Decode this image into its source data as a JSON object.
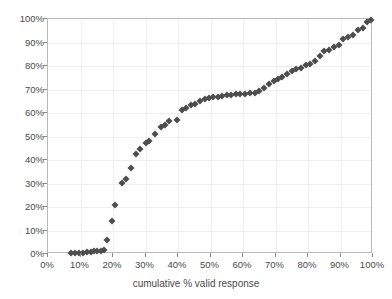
{
  "chart_data": {
    "type": "scatter",
    "title": "",
    "xlabel": "cumulative % valid response",
    "ylabel": "",
    "xlim": [
      0,
      100
    ],
    "ylim": [
      0,
      100
    ],
    "grid": true,
    "legend": null,
    "marker": {
      "shape": "diamond",
      "color": "#4d4d4d",
      "size": 5
    },
    "x_ticks": [
      "0%",
      "10%",
      "20%",
      "30%",
      "40%",
      "50%",
      "60%",
      "70%",
      "80%",
      "90%",
      "100%"
    ],
    "y_ticks": [
      "0%",
      "10%",
      "20%",
      "30%",
      "40%",
      "50%",
      "60%",
      "70%",
      "80%",
      "90%",
      "100%"
    ],
    "x_tick_values": [
      0,
      10,
      20,
      30,
      40,
      50,
      60,
      70,
      80,
      90,
      100
    ],
    "y_tick_values": [
      0,
      10,
      20,
      30,
      40,
      50,
      60,
      70,
      80,
      90,
      100
    ],
    "points": [
      {
        "x": 7.0,
        "y": 0.3
      },
      {
        "x": 8.3,
        "y": 0.4
      },
      {
        "x": 9.6,
        "y": 0.5
      },
      {
        "x": 10.8,
        "y": 0.6
      },
      {
        "x": 12.0,
        "y": 0.7
      },
      {
        "x": 13.2,
        "y": 0.9
      },
      {
        "x": 14.2,
        "y": 1.1
      },
      {
        "x": 15.2,
        "y": 1.3
      },
      {
        "x": 16.2,
        "y": 1.4
      },
      {
        "x": 17.2,
        "y": 1.5
      },
      {
        "x": 18.3,
        "y": 5.8
      },
      {
        "x": 19.6,
        "y": 14.2
      },
      {
        "x": 20.7,
        "y": 20.8
      },
      {
        "x": 22.8,
        "y": 30.2
      },
      {
        "x": 24.0,
        "y": 31.8
      },
      {
        "x": 25.4,
        "y": 36.6
      },
      {
        "x": 27.0,
        "y": 42.5
      },
      {
        "x": 28.3,
        "y": 44.5
      },
      {
        "x": 30.0,
        "y": 47.3
      },
      {
        "x": 31.2,
        "y": 48.0
      },
      {
        "x": 33.0,
        "y": 51.0
      },
      {
        "x": 34.8,
        "y": 54.2
      },
      {
        "x": 35.9,
        "y": 55.0
      },
      {
        "x": 37.1,
        "y": 56.8
      },
      {
        "x": 39.8,
        "y": 56.9
      },
      {
        "x": 41.3,
        "y": 61.2
      },
      {
        "x": 42.4,
        "y": 62.0
      },
      {
        "x": 44.0,
        "y": 63.5
      },
      {
        "x": 45.3,
        "y": 64.0
      },
      {
        "x": 46.8,
        "y": 65.0
      },
      {
        "x": 48.2,
        "y": 66.0
      },
      {
        "x": 49.5,
        "y": 66.3
      },
      {
        "x": 50.8,
        "y": 66.8
      },
      {
        "x": 52.2,
        "y": 67.0
      },
      {
        "x": 53.6,
        "y": 67.3
      },
      {
        "x": 55.0,
        "y": 67.5
      },
      {
        "x": 56.4,
        "y": 67.8
      },
      {
        "x": 57.8,
        "y": 68.0
      },
      {
        "x": 59.2,
        "y": 68.0
      },
      {
        "x": 60.5,
        "y": 68.1
      },
      {
        "x": 62.0,
        "y": 68.3
      },
      {
        "x": 63.6,
        "y": 68.5
      },
      {
        "x": 65.0,
        "y": 69.2
      },
      {
        "x": 66.4,
        "y": 70.5
      },
      {
        "x": 68.0,
        "y": 72.4
      },
      {
        "x": 69.4,
        "y": 73.5
      },
      {
        "x": 70.7,
        "y": 74.3
      },
      {
        "x": 72.0,
        "y": 75.2
      },
      {
        "x": 73.6,
        "y": 76.8
      },
      {
        "x": 75.0,
        "y": 78.0
      },
      {
        "x": 76.4,
        "y": 78.8
      },
      {
        "x": 77.8,
        "y": 79.3
      },
      {
        "x": 79.3,
        "y": 80.3
      },
      {
        "x": 80.6,
        "y": 81.0
      },
      {
        "x": 82.0,
        "y": 82.0
      },
      {
        "x": 83.6,
        "y": 84.2
      },
      {
        "x": 85.0,
        "y": 86.2
      },
      {
        "x": 86.5,
        "y": 87.0
      },
      {
        "x": 88.0,
        "y": 88.0
      },
      {
        "x": 89.4,
        "y": 89.0
      },
      {
        "x": 90.8,
        "y": 91.3
      },
      {
        "x": 92.2,
        "y": 92.3
      },
      {
        "x": 93.8,
        "y": 93.0
      },
      {
        "x": 95.4,
        "y": 95.5
      },
      {
        "x": 96.8,
        "y": 96.3
      },
      {
        "x": 98.2,
        "y": 98.8
      },
      {
        "x": 99.4,
        "y": 99.7
      }
    ]
  }
}
